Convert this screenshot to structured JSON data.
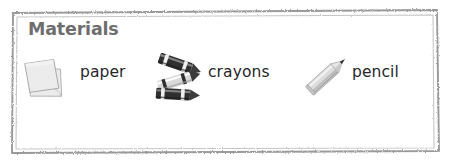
{
  "panel": {
    "title": "Materials",
    "title_color": "#6e6e6e",
    "background_color": "#ffffff",
    "border_color": "#9a9a9a",
    "border_style": "rough-hand-drawn-rectangle",
    "label_color": "#26262a"
  },
  "materials": [
    {
      "icon": "paper-stack-icon",
      "label": "paper",
      "icon_colors": {
        "sheet": "#e9e9e9",
        "edge": "#b4b4b4",
        "texture": "#d3d3d3"
      }
    },
    {
      "icon": "crayons-icon",
      "label": "crayons",
      "icon_colors": {
        "body": "#2e2e2e",
        "wrapper": "#f2f2f2",
        "highlight": "#8d8d8d"
      }
    },
    {
      "icon": "pencil-icon",
      "label": "pencil",
      "icon_colors": {
        "body": "#d8d8d8",
        "shade": "#a9a9a9",
        "tip": "#2a2a2a"
      }
    }
  ]
}
